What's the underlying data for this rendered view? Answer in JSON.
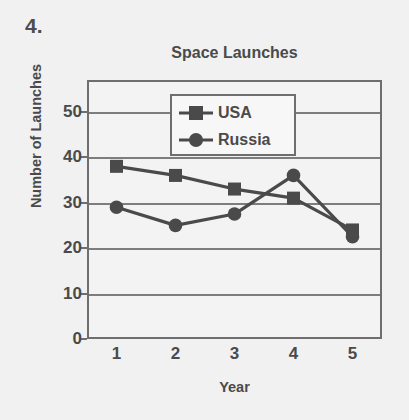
{
  "question": {
    "number": "4."
  },
  "chart_data": {
    "type": "line",
    "title": "Space Launches",
    "xlabel": "Year",
    "ylabel": "Number of Launches",
    "categories": [
      "1",
      "2",
      "3",
      "4",
      "5"
    ],
    "x": [
      1,
      2,
      3,
      4,
      5
    ],
    "xlim": [
      0.5,
      5.5
    ],
    "ylim": [
      0,
      57
    ],
    "yticks": [
      0,
      10,
      20,
      30,
      40,
      50
    ],
    "ytick_labels": [
      "0",
      "10",
      "20",
      "30",
      "40",
      "50"
    ],
    "grid": "horizontal",
    "legend_position": "top-center",
    "series": [
      {
        "name": "USA",
        "marker": "square",
        "color": "#4a4a4a",
        "values": [
          38,
          36,
          33,
          31,
          24
        ]
      },
      {
        "name": "Russia",
        "marker": "circle",
        "color": "#4a4a4a",
        "values": [
          29,
          25,
          27.5,
          36,
          22.5
        ]
      }
    ]
  },
  "colors": {
    "background": "#f1f1f1",
    "ink": "#4a4a4a",
    "axis": "#6e6e6e",
    "grid": "#7d7d7d",
    "plot_background": "#f3f3f3",
    "legend_background": "#f7f7f7"
  }
}
